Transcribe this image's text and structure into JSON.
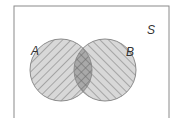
{
  "diagram": {
    "type": "venn",
    "universe_label": "S",
    "sets": [
      {
        "label": "A",
        "hatch": "forward-diagonal"
      },
      {
        "label": "B",
        "hatch": "backward-diagonal"
      }
    ],
    "intersection": {
      "sets": [
        "A",
        "B"
      ],
      "hatch": "crosshatch",
      "shaded": true
    },
    "colors": {
      "background": "#ffffff",
      "frame": "#8a8a8a",
      "set_fill": "#d8d8d8",
      "intersection_fill": "#a9a9a9",
      "hatch_line": "#7a7a7a",
      "outline": "#8c8c8c",
      "label": "#333333"
    }
  }
}
